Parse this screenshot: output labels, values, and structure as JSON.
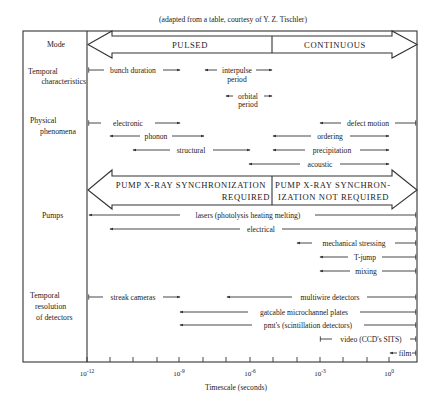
{
  "caption": "(adapted from a table, courtesy of Y. Z. Tischler)",
  "xaxis": {
    "label": "Timescale (seconds)",
    "ticks_x": [
      87,
      110,
      133,
      157,
      179,
      203,
      226,
      250,
      273,
      297,
      320,
      343,
      367,
      389
    ],
    "major_labels": [
      {
        "x": 87,
        "base": "10",
        "exp": "-12"
      },
      {
        "x": 179,
        "base": "10",
        "exp": "-9"
      },
      {
        "x": 250,
        "base": "10",
        "exp": "-6"
      },
      {
        "x": 320,
        "base": "10",
        "exp": "-3"
      },
      {
        "x": 389,
        "base": "10",
        "exp": "0"
      }
    ]
  },
  "rows": {
    "mode": "Mode",
    "temporal_line1": "Temporal",
    "temporal_line2": "characteristics",
    "physical_line1": "Physical",
    "physical_line2": "phenomena",
    "pumps": "Pumps",
    "detectors_line1": "Temporal",
    "detectors_line2": "resolution",
    "detectors_line3": "of detectors"
  },
  "mode_arrow": {
    "left": "PULSED",
    "right": "CONTINUOUS"
  },
  "pump_arrow": {
    "left_line1": "PUMP X-RAY SYNCHRONIZATION",
    "left_line2": "REQUIRED",
    "right_line1": "PUMP X-RAY SYNCHRON-",
    "right_line2": "IZATION NOT REQUIRED"
  },
  "temporal": {
    "bunch_duration": "bunch duration",
    "interpulse": "interpulse",
    "interpulse_2": "period",
    "orbital": "orbital",
    "orbital_2": "period"
  },
  "physical": {
    "electronic": "electronic",
    "phonon": "phonon",
    "structural": "structural",
    "defect_motion": "defect motion",
    "ordering": "ordering",
    "precipitation": "precipitation",
    "acoustic": "acoustic"
  },
  "pumps": {
    "lasers": "lasers (photolysis heating melting)",
    "electrical": "electrical",
    "mechanical": "mechanical stressing",
    "tjump": "T-jump",
    "mixing": "mixing"
  },
  "detectors": {
    "streak": "streak cameras",
    "multiwire": "multiwire detectors",
    "gatcable": "gatcable microchannel plates",
    "pmt": "pmt's (scintillation detectors)",
    "video": "video (CCD's SITS)",
    "film": "film"
  }
}
